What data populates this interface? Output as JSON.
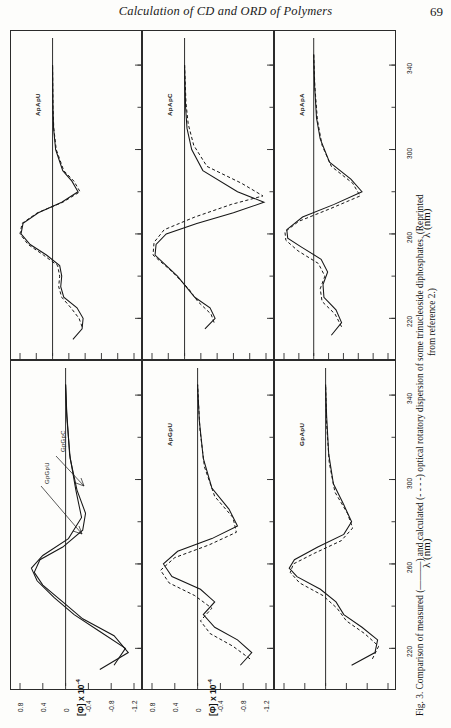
{
  "runninghead": {
    "title": "Calculation of CD and ORD of Polymers",
    "page_number": "69"
  },
  "figure": {
    "caption_lines": [
      "Fig. 3.  Comparison of measured (———) and calculated (- - - -) optical rotatory dispersion of some trinucleoside diphosphates. (Reprinted",
      "from reference 2.)"
    ],
    "x_axis_title": "λ (nm)",
    "x_ticks": [
      "220",
      "260",
      "300",
      "340"
    ],
    "y_axis_title_top": "[Φ] x 10⁻⁴",
    "y_axis_title_bottom": "[Φ] x 10⁻⁴",
    "y_ticks_top": [
      "1.6",
      "0.8",
      "0",
      "-0.8",
      "-1.6",
      "-2.4",
      "-3.2",
      "-4.0"
    ],
    "y_ticks_bottom": [
      "0.8",
      "0.4",
      "0",
      "-0.4",
      "-0.8",
      "-1.2"
    ],
    "panels": [
      {
        "id": "p1",
        "label": "ApApU",
        "curve_labels": []
      },
      {
        "id": "p2",
        "label": "ApApC",
        "curve_labels": []
      },
      {
        "id": "p3",
        "label": "ApApA",
        "curve_labels": []
      },
      {
        "id": "p4",
        "label": "",
        "curve_labels": [
          "GpGpC",
          "GpGpU"
        ]
      },
      {
        "id": "p5",
        "label": "ApGpU",
        "curve_labels": []
      },
      {
        "id": "p6",
        "label": "GpApU",
        "curve_labels": []
      }
    ]
  },
  "chart_data": {
    "type": "line",
    "xlabel": "λ (nm)",
    "ylabel": "[Φ] x 10⁻⁴",
    "xlim": [
      205,
      350
    ],
    "xticks": [
      220,
      260,
      300,
      340
    ],
    "grid": false,
    "legend": [
      "measured (solid)",
      "calculated (dashed)"
    ],
    "panels": [
      {
        "name": "ApApU",
        "ylim": [
          -4.0,
          1.6
        ],
        "yticks": [
          1.6,
          0.8,
          0,
          -0.8,
          -1.6,
          -2.4,
          -3.2,
          -4.0
        ],
        "series": [
          {
            "name": "measured",
            "style": "solid",
            "x": [
              210,
              215,
              220,
              225,
              230,
              235,
              240,
              245,
              250,
              255,
              260,
              265,
              270,
              275,
              280,
              285,
              290,
              300,
              310,
              320,
              340
            ],
            "values": [
              -1.0,
              -1.45,
              -1.5,
              -1.2,
              -0.55,
              -0.4,
              -0.45,
              -0.35,
              0.3,
              1.1,
              1.55,
              1.45,
              0.7,
              -0.45,
              -1.25,
              -0.95,
              -0.5,
              -0.15,
              -0.05,
              -0.02,
              0.0
            ]
          },
          {
            "name": "calculated",
            "style": "dashed",
            "x": [
              216,
              220,
              225,
              230,
              235,
              240,
              245,
              250,
              255,
              260,
              265,
              270,
              275,
              280,
              285,
              290,
              300,
              310,
              320,
              340
            ],
            "values": [
              -1.45,
              -1.3,
              -0.9,
              -0.45,
              -0.3,
              -0.35,
              -0.25,
              0.45,
              1.2,
              1.6,
              1.5,
              0.75,
              -0.5,
              -1.35,
              -1.05,
              -0.55,
              -0.18,
              -0.06,
              -0.02,
              0.0
            ]
          }
        ]
      },
      {
        "name": "ApApC",
        "ylim": [
          -4.0,
          1.6
        ],
        "yticks": [
          1.6,
          0.8,
          0,
          -0.8,
          -1.6,
          -2.4,
          -3.2,
          -4.0
        ],
        "series": [
          {
            "name": "measured",
            "style": "solid",
            "x": [
              215,
              220,
              225,
              230,
              240,
              250,
              255,
              260,
              265,
              270,
              275,
              280,
              290,
              300,
              310,
              320,
              340
            ],
            "values": [
              -1.0,
              -1.5,
              -1.25,
              -0.5,
              0.35,
              1.45,
              1.4,
              0.9,
              -0.6,
              -2.4,
              -3.9,
              -2.6,
              -0.9,
              -0.35,
              -0.12,
              -0.05,
              0.0
            ]
          },
          {
            "name": "calculated",
            "style": "dashed",
            "x": [
              218,
              222,
              228,
              234,
              242,
              250,
              256,
              262,
              268,
              274,
              278,
              284,
              292,
              302,
              312,
              322,
              340
            ],
            "values": [
              -1.45,
              -1.3,
              -0.65,
              -0.2,
              0.6,
              1.55,
              1.5,
              1.0,
              -0.5,
              -2.3,
              -3.85,
              -2.8,
              -1.1,
              -0.45,
              -0.18,
              -0.07,
              0.0
            ]
          }
        ]
      },
      {
        "name": "ApApA",
        "ylim": [
          -4.0,
          1.6
        ],
        "yticks": [
          1.6,
          0.8,
          0,
          -0.8,
          -1.6,
          -2.4,
          -3.2,
          -4.0
        ],
        "series": [
          {
            "name": "measured",
            "style": "solid",
            "x": [
              212,
              218,
              224,
              230,
              236,
              242,
              248,
              254,
              258,
              262,
              268,
              274,
              280,
              286,
              294,
              305,
              315,
              330,
              345
            ],
            "values": [
              -0.95,
              -1.5,
              -1.2,
              -0.55,
              -0.5,
              -0.75,
              -0.4,
              0.7,
              1.4,
              1.45,
              0.6,
              -1.1,
              -2.6,
              -2.0,
              -0.85,
              -0.35,
              -0.15,
              -0.05,
              0.0
            ]
          },
          {
            "name": "calculated",
            "style": "dashed",
            "x": [
              216,
              222,
              228,
              234,
              240,
              246,
              252,
              257,
              261,
              266,
              272,
              278,
              284,
              292,
              302,
              314,
              330,
              345
            ],
            "values": [
              -1.5,
              -1.15,
              -0.45,
              -0.35,
              -0.6,
              -0.25,
              0.85,
              1.5,
              1.55,
              0.8,
              -0.9,
              -2.5,
              -2.1,
              -0.95,
              -0.45,
              -0.2,
              -0.06,
              0.0
            ]
          }
        ]
      },
      {
        "name": "GpGpC / GpGpU",
        "ylim": [
          -1.2,
          0.8
        ],
        "yticks": [
          0.8,
          0.4,
          0,
          -0.4,
          -0.8,
          -1.2
        ],
        "series": [
          {
            "name": "GpGpC measured",
            "style": "solid",
            "x": [
              210,
              218,
              226,
              234,
              242,
              250,
              256,
              262,
              268,
              276,
              284,
              295,
              310,
              330,
              345
            ],
            "values": [
              -0.6,
              -1.1,
              -0.85,
              -0.3,
              0.05,
              0.4,
              0.55,
              0.45,
              0.05,
              -0.3,
              -0.35,
              -0.2,
              -0.08,
              -0.02,
              0.0
            ]
          },
          {
            "name": "GpGpU measured",
            "style": "solid",
            "x": [
              212,
              220,
              228,
              236,
              244,
              252,
              258,
              264,
              272,
              282,
              295,
              312,
              332,
              345
            ],
            "values": [
              -0.85,
              -1.05,
              -0.6,
              -0.15,
              0.2,
              0.5,
              0.6,
              0.4,
              -0.05,
              -0.28,
              -0.18,
              -0.07,
              -0.02,
              0.0
            ]
          }
        ]
      },
      {
        "name": "ApGpU",
        "ylim": [
          -1.2,
          0.8
        ],
        "yticks": [
          0.8,
          0.4,
          0,
          -0.4,
          -0.8,
          -1.2
        ],
        "series": [
          {
            "name": "measured",
            "style": "solid",
            "x": [
              212,
              218,
              224,
              230,
              236,
              242,
              248,
              254,
              260,
              266,
              272,
              278,
              286,
              296,
              310,
              328,
              345
            ],
            "values": [
              -0.75,
              -0.95,
              -0.7,
              -0.3,
              -0.1,
              -0.3,
              -0.05,
              0.45,
              0.6,
              0.35,
              -0.25,
              -0.7,
              -0.55,
              -0.25,
              -0.1,
              -0.03,
              0.0
            ]
          },
          {
            "name": "calculated",
            "style": "dashed",
            "x": [
              215,
              221,
              227,
              233,
              239,
              245,
              251,
              257,
              263,
              269,
              275,
              282,
              292,
              306,
              324,
              345
            ],
            "values": [
              -0.92,
              -0.62,
              -0.22,
              -0.05,
              -0.25,
              0.05,
              0.5,
              0.65,
              0.4,
              -0.2,
              -0.68,
              -0.62,
              -0.3,
              -0.12,
              -0.04,
              0.0
            ]
          }
        ]
      },
      {
        "name": "GpApU",
        "ylim": [
          -1.2,
          0.8
        ],
        "yticks": [
          0.8,
          0.4,
          0,
          -0.4,
          -0.8,
          -1.2
        ],
        "series": [
          {
            "name": "measured",
            "style": "solid",
            "x": [
              212,
              218,
              224,
              230,
              236,
              242,
              248,
              254,
              258,
              262,
              268,
              274,
              280,
              288,
              298,
              312,
              330,
              345
            ],
            "values": [
              -0.5,
              -0.95,
              -1.0,
              -0.7,
              -0.35,
              -0.2,
              0.1,
              0.55,
              0.7,
              0.6,
              0.15,
              -0.35,
              -0.5,
              -0.35,
              -0.15,
              -0.06,
              -0.02,
              0.0
            ]
          },
          {
            "name": "calculated",
            "style": "dashed",
            "x": [
              215,
              221,
              227,
              233,
              239,
              245,
              251,
              256,
              260,
              265,
              271,
              277,
              284,
              294,
              308,
              326,
              345
            ],
            "values": [
              -0.9,
              -1.02,
              -0.75,
              -0.4,
              -0.22,
              0.05,
              0.5,
              0.68,
              0.62,
              0.22,
              -0.3,
              -0.52,
              -0.42,
              -0.18,
              -0.07,
              -0.02,
              0.0
            ]
          }
        ]
      }
    ]
  }
}
